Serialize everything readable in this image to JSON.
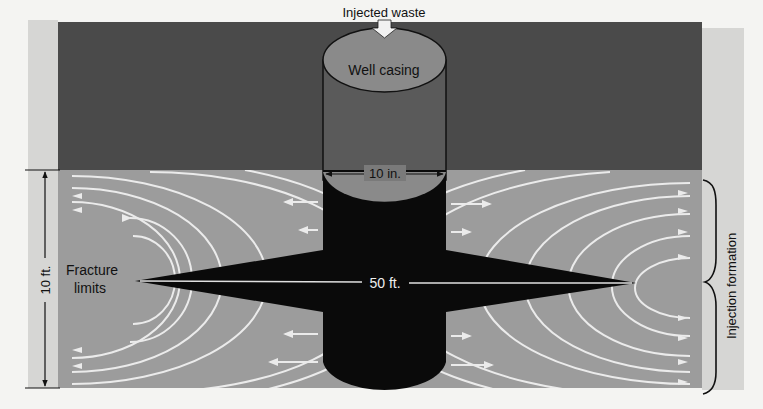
{
  "figure": {
    "labels": {
      "injected_waste": "Injected waste",
      "well_casing": "Well casing",
      "casing_diameter": "10 in.",
      "fracture_length": "50 ft.",
      "formation_thickness": "10 ft.",
      "fracture_limits_line1": "Fracture",
      "fracture_limits_line2": "limits",
      "injection_formation": "Injection formation"
    },
    "colors": {
      "overburden": "#4a4a4a",
      "formation": "#9c9c9c",
      "side_strip": "#d6d6d4",
      "fracture": "#0a0a0a",
      "flow_lines": "#ebebeb",
      "casing_top": "#8a8a8a",
      "background": "#f4f4f2"
    }
  }
}
